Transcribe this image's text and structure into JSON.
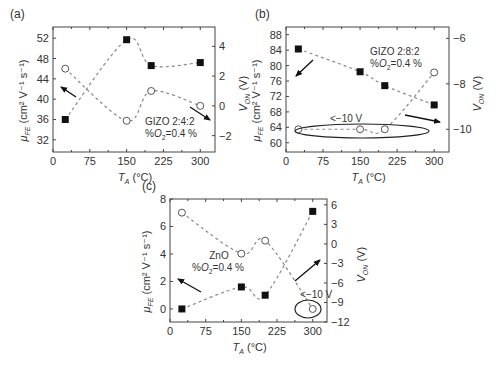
{
  "chart_data": [
    {
      "type": "scatter",
      "panel_label": "(a)",
      "annotation": [
        "GIZO 2:4:2",
        "%O₂=0.4 %"
      ],
      "xlabel": "T_A (°C)",
      "ylabel_left": "μ_FE (cm² V⁻¹ s⁻¹)",
      "ylabel_right": "V_ON (V)",
      "xticks": [
        0,
        75,
        150,
        225,
        300
      ],
      "yticks_left": [
        32,
        36,
        40,
        44,
        48,
        52
      ],
      "yticks_right": [
        -2,
        0,
        2,
        4
      ],
      "xlim": [
        0,
        330
      ],
      "ylim_left": [
        29.6,
        54.2
      ],
      "ylim_right": [
        -3.1,
        5.3
      ],
      "series": [
        {
          "name": "mu_FE",
          "marker": "filled-square",
          "axis": "left",
          "x": [
            25,
            150,
            200,
            300
          ],
          "y": [
            36.0,
            51.7,
            46.6,
            47.2
          ]
        },
        {
          "name": "V_ON",
          "marker": "open-circle",
          "axis": "right",
          "x": [
            25,
            150,
            200,
            300
          ],
          "y": [
            2.5,
            -1.0,
            1.0,
            0.0
          ]
        }
      ],
      "grid": false
    },
    {
      "type": "scatter",
      "panel_label": "(b)",
      "annotation": [
        "GIZO 2:8:2",
        "%O₂=0.4 %"
      ],
      "extra_annotation": "<−10 V",
      "xlabel": "T_A (°C)",
      "ylabel_left": "μ_FE (cm² V⁻¹ s⁻¹)",
      "ylabel_right": "V_ON (V)",
      "xticks": [
        0,
        75,
        150,
        225,
        300
      ],
      "yticks_left": [
        60,
        64,
        68,
        72,
        76,
        80,
        84,
        88
      ],
      "yticks_right": [
        -10,
        -8,
        -6
      ],
      "xlim": [
        0,
        330
      ],
      "ylim_left": [
        57.6,
        90
      ],
      "ylim_right": [
        -11,
        -5.5
      ],
      "series": [
        {
          "name": "mu_FE",
          "marker": "filled-square",
          "axis": "left",
          "x": [
            25,
            150,
            200,
            300
          ],
          "y": [
            84.3,
            78.4,
            74.8,
            69.8
          ]
        },
        {
          "name": "V_ON",
          "marker": "open-circle",
          "axis": "right",
          "x": [
            25,
            150,
            200,
            300
          ],
          "y": [
            -10,
            -10,
            -10,
            -7.5
          ]
        }
      ],
      "grid": false
    },
    {
      "type": "scatter",
      "panel_label": "(c)",
      "annotation": [
        "ZnO",
        "%O₂=0.4 %"
      ],
      "extra_annotation": "<−10 V",
      "xlabel": "T_A (°C)",
      "ylabel_left": "μ_FE (cm² V⁻¹ s⁻¹)",
      "ylabel_right": "V_ON (V)",
      "xticks": [
        0,
        75,
        150,
        225,
        300
      ],
      "yticks_left": [
        0,
        2,
        4,
        6,
        8
      ],
      "yticks_right": [
        -12,
        -9,
        -6,
        -3,
        0,
        3,
        6
      ],
      "xlim": [
        0,
        330
      ],
      "ylim_left": [
        -0.95,
        8
      ],
      "ylim_right": [
        -12,
        6.9
      ],
      "series": [
        {
          "name": "mu_FE",
          "marker": "filled-square",
          "axis": "left",
          "x": [
            25,
            150,
            200,
            300
          ],
          "y": [
            0.0,
            1.6,
            1.0,
            7.1
          ]
        },
        {
          "name": "V_ON",
          "marker": "open-circle",
          "axis": "right",
          "x": [
            25,
            150,
            200,
            300
          ],
          "y": [
            4.8,
            -1.5,
            0.5,
            -10
          ]
        }
      ],
      "grid": false
    }
  ],
  "labels": {
    "a": {
      "panel": "(a)",
      "ann1": "GIZO 2:4:2",
      "ann2_pre": "%",
      "ann2_o": "O",
      "ann2_sub": "2",
      "ann2_post": "=0.4 %"
    },
    "b": {
      "panel": "(b)",
      "ann1": "GIZO 2:8:2",
      "ann2_pre": "%",
      "ann2_o": "O",
      "ann2_sub": "2",
      "ann2_post": "=0.4 %",
      "ann3": "<−10 V"
    },
    "c": {
      "panel": "(c)",
      "ann1": "ZnO",
      "ann2_pre": "%",
      "ann2_o": "O",
      "ann2_sub": "2",
      "ann2_post": "=0.4 %",
      "ann3": "<−10 V"
    },
    "xlabel_T": "T",
    "xlabel_sub": "A",
    "xlabel_unit": " (°C)",
    "ylabel_mu": "μ",
    "ylabel_mu_sub": "FE",
    "ylabel_mu_unit": " (cm² V⁻¹ s⁻¹)",
    "ylabel_v": "V",
    "ylabel_v_sub": "ON",
    "ylabel_v_unit": " (V)"
  }
}
